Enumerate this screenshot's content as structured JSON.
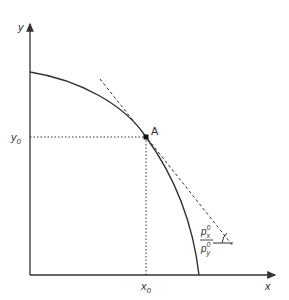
{
  "diagram": {
    "type": "production-possibility-frontier",
    "axes": {
      "x_label": "x",
      "y_label": "y"
    },
    "point": {
      "label": "A",
      "x_label_base": "x",
      "x_label_sub": "0",
      "y_label_base": "y",
      "y_label_sub": "0"
    },
    "slope_label": {
      "numerator_base": "p",
      "numerator_sup": "0",
      "numerator_sub": "x",
      "denominator_base": "p",
      "denominator_sup": "0",
      "denominator_sub": "y"
    },
    "colors": {
      "line": "#333333",
      "background": "#ffffff"
    }
  }
}
